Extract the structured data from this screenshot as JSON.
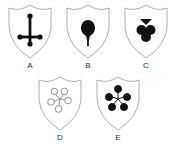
{
  "figure": {
    "colors": {
      "shield_outline": "#9a9a9a",
      "shield_fill": "#ffffff",
      "symbol_fill": "#111111",
      "label_text": "#333333"
    },
    "shields": [
      {
        "label": "A",
        "symbol": "inverted-cross-with-ball-ends",
        "filled": true
      },
      {
        "label": "B",
        "symbol": "round-pin-teardrop",
        "filled": true
      },
      {
        "label": "C",
        "symbol": "three-lobed-club-with-triangle",
        "filled": true
      },
      {
        "label": "D",
        "symbol": "five-petal-flower-outline",
        "filled": false
      },
      {
        "label": "E",
        "symbol": "five-petal-flower-solid",
        "filled": true
      }
    ]
  }
}
